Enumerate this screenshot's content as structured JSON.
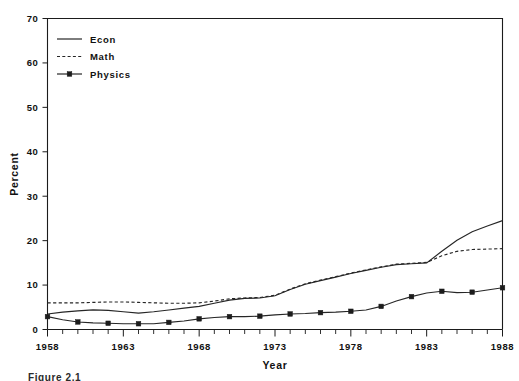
{
  "chart_data": {
    "type": "line",
    "title": "",
    "xlabel": "Year",
    "ylabel": "Percent",
    "xlim": [
      1958,
      1988
    ],
    "ylim": [
      0,
      70
    ],
    "ytick_step": 10,
    "yticks": [
      0,
      10,
      20,
      30,
      40,
      50,
      60,
      70
    ],
    "xticks": [
      1958,
      1963,
      1968,
      1973,
      1978,
      1983,
      1988
    ],
    "x_minor_tick_interval": 1,
    "grid": false,
    "legend_position": "top-left",
    "x": [
      1958,
      1959,
      1960,
      1961,
      1962,
      1963,
      1964,
      1965,
      1966,
      1967,
      1968,
      1969,
      1970,
      1971,
      1972,
      1973,
      1974,
      1975,
      1976,
      1977,
      1978,
      1979,
      1980,
      1981,
      1982,
      1983,
      1984,
      1985,
      1986,
      1987,
      1988
    ],
    "series": [
      {
        "name": "Econ",
        "style": "solid",
        "marker": "none",
        "values": [
          3.5,
          3.9,
          4.2,
          4.4,
          4.3,
          4.0,
          3.7,
          4.0,
          4.4,
          4.8,
          5.2,
          5.9,
          6.6,
          7.0,
          7.1,
          7.6,
          9.0,
          10.2,
          11.0,
          11.8,
          12.6,
          13.3,
          14.0,
          14.6,
          14.8,
          15.0,
          17.6,
          20.1,
          22.0,
          23.3,
          24.5
        ]
      },
      {
        "name": "Math",
        "style": "dashed",
        "marker": "none",
        "values": [
          6.0,
          6.0,
          6.0,
          6.1,
          6.2,
          6.2,
          6.1,
          6.0,
          5.9,
          5.9,
          6.0,
          6.4,
          6.9,
          7.1,
          7.2,
          7.7,
          9.1,
          10.3,
          11.1,
          11.9,
          12.7,
          13.4,
          14.1,
          14.7,
          14.9,
          15.1,
          16.6,
          17.6,
          18.0,
          18.1,
          18.2
        ]
      },
      {
        "name": "Physics",
        "style": "solid",
        "marker": "square",
        "marker_interval_years": 2,
        "values": [
          2.9,
          2.2,
          1.7,
          1.5,
          1.4,
          1.3,
          1.3,
          1.3,
          1.6,
          1.9,
          2.4,
          2.7,
          2.9,
          2.9,
          3.0,
          3.3,
          3.5,
          3.6,
          3.8,
          3.9,
          4.1,
          4.4,
          5.2,
          6.4,
          7.4,
          8.2,
          8.6,
          8.3,
          8.4,
          8.9,
          9.4
        ]
      }
    ],
    "legend": [
      {
        "label": "Econ",
        "style": "solid",
        "marker": "none"
      },
      {
        "label": "Math",
        "style": "dashed",
        "marker": "none"
      },
      {
        "label": "Physics",
        "style": "solid",
        "marker": "square"
      }
    ]
  },
  "caption": "Figure 2.1"
}
